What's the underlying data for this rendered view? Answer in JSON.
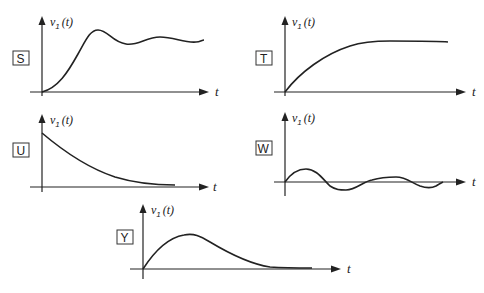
{
  "figure": {
    "panels": [
      {
        "id": "S",
        "label": "S",
        "y_axis_label": "v",
        "y_axis_subscript": "1",
        "y_axis_arg": "(t)",
        "x_axis_label": "t",
        "description": "overshoot then damped oscillation settling to constant"
      },
      {
        "id": "T",
        "label": "T",
        "y_axis_label": "v",
        "y_axis_subscript": "1",
        "y_axis_arg": "(t)",
        "x_axis_label": "t",
        "description": "monotonic rise to constant (overdamped)"
      },
      {
        "id": "U",
        "label": "U",
        "y_axis_label": "v",
        "y_axis_subscript": "1",
        "y_axis_arg": "(t)",
        "x_axis_label": "t",
        "description": "exponential decay from initial value to zero"
      },
      {
        "id": "W",
        "label": "W",
        "y_axis_label": "v",
        "y_axis_subscript": "1",
        "y_axis_arg": "(t)",
        "x_axis_label": "t",
        "description": "damped oscillation about zero"
      },
      {
        "id": "Y",
        "label": "Y",
        "y_axis_label": "v",
        "y_axis_subscript": "1",
        "y_axis_arg": "(t)",
        "x_axis_label": "t",
        "description": "rise from zero to a peak then decay to zero"
      }
    ]
  }
}
